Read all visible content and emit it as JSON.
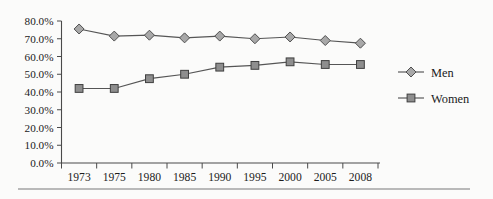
{
  "chart_data": {
    "type": "line",
    "title": "",
    "xlabel": "",
    "ylabel": "",
    "categories": [
      "1973",
      "1975",
      "1980",
      "1985",
      "1990",
      "1995",
      "2000",
      "2005",
      "2008"
    ],
    "series": [
      {
        "name": "Men",
        "marker": "diamond",
        "values": [
          75.5,
          71.5,
          72.0,
          70.5,
          71.5,
          70.0,
          71.0,
          69.0,
          67.5
        ]
      },
      {
        "name": "Women",
        "marker": "square",
        "values": [
          42.0,
          42.0,
          47.5,
          50.0,
          54.0,
          55.0,
          57.0,
          55.5,
          55.5
        ]
      }
    ],
    "ylim": [
      0,
      80
    ],
    "ytick_values": [
      0,
      10,
      20,
      30,
      40,
      50,
      60,
      70,
      80
    ],
    "ytick_labels": [
      "0.0%",
      "10.0%",
      "20.0%",
      "30.0%",
      "40.0%",
      "50.0%",
      "60.0%",
      "70.0%",
      "80.0%"
    ],
    "grid": false,
    "legend_position": "right",
    "legend_entries": [
      "Men",
      "Women"
    ],
    "colors": {
      "men_marker_fill": "#a8a8a8",
      "women_marker_fill": "#8e8e8e",
      "line": "#555555",
      "axis": "#4a4a4a",
      "text": "#1d1d1d",
      "background": "#fbfbfa",
      "rule": "#b9b9b9"
    }
  }
}
